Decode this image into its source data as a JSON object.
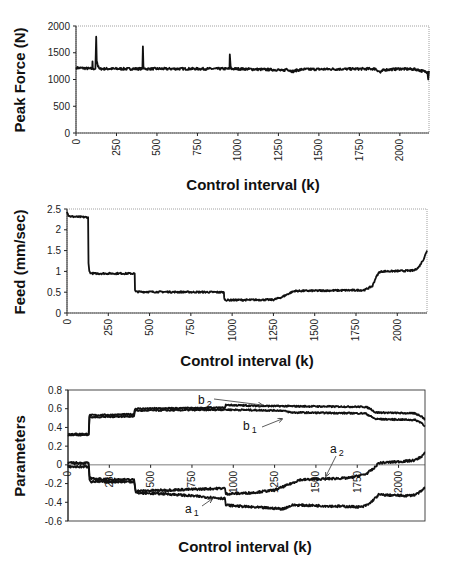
{
  "chart_data": [
    {
      "id": "peak_force",
      "type": "line",
      "title": "",
      "xlabel": "Control interval (k)",
      "ylabel": "Peak Force (N)",
      "xlim": [
        0,
        2180
      ],
      "ylim": [
        0,
        2000
      ],
      "xticks": [
        0,
        250,
        500,
        750,
        1000,
        1250,
        1500,
        1750,
        2000
      ],
      "yticks": [
        0,
        500,
        1000,
        1500,
        2000
      ],
      "ytick_labels": [
        "0",
        "500",
        "1000",
        "1500",
        "2000"
      ],
      "grid": false,
      "series": [
        {
          "name": "Peak Force",
          "color": "#111111",
          "noise": 22,
          "x": [
            0,
            5,
            100,
            102,
            104,
            120,
            125,
            128,
            131,
            135,
            145,
            150,
            400,
            410,
            413,
            416,
            420,
            425,
            940,
            948,
            950,
            955,
            960,
            1000,
            1250,
            1280,
            1300,
            1320,
            1340,
            1360,
            1400,
            1850,
            1880,
            1900,
            2000,
            2100,
            2150,
            2170,
            2175,
            2180
          ],
          "y": [
            1200,
            1220,
            1200,
            1340,
            1200,
            1200,
            1800,
            1350,
            1320,
            1250,
            1200,
            1200,
            1200,
            1200,
            1620,
            1250,
            1200,
            1200,
            1200,
            1200,
            1470,
            1250,
            1200,
            1200,
            1180,
            1160,
            1200,
            1170,
            1150,
            1170,
            1190,
            1200,
            1130,
            1180,
            1200,
            1190,
            1150,
            1140,
            1000,
            1160
          ]
        }
      ]
    },
    {
      "id": "feed",
      "type": "line",
      "title": "",
      "xlabel": "Control interval (k)",
      "ylabel": "Feed (mm/sec)",
      "xlim": [
        0,
        2180
      ],
      "ylim": [
        0,
        2.5
      ],
      "xticks": [
        0,
        250,
        500,
        750,
        1000,
        1250,
        1500,
        1750,
        2000
      ],
      "yticks": [
        0,
        0.5,
        1,
        1.5,
        2,
        2.5
      ],
      "ytick_labels": [
        "0",
        "0.5",
        "1",
        "1.5",
        "2",
        "2.5"
      ],
      "grid": false,
      "series": [
        {
          "name": "Feed",
          "color": "#111111",
          "noise": 0.02,
          "x": [
            0,
            8,
            20,
            128,
            130,
            135,
            145,
            150,
            410,
            412,
            418,
            950,
            952,
            960,
            1250,
            1300,
            1360,
            1380,
            1800,
            1850,
            1870,
            1890,
            1910,
            2100,
            2130,
            2160,
            2180
          ],
          "y": [
            2.45,
            2.35,
            2.32,
            2.3,
            1.2,
            1.0,
            0.96,
            0.95,
            0.95,
            0.55,
            0.51,
            0.5,
            0.35,
            0.31,
            0.32,
            0.38,
            0.5,
            0.53,
            0.55,
            0.65,
            0.85,
            0.98,
            1.0,
            1.02,
            1.1,
            1.3,
            1.5
          ]
        }
      ]
    },
    {
      "id": "parameters",
      "type": "line",
      "title": "",
      "xlabel": "Control interval (k)",
      "ylabel": "Parameters",
      "xlim": [
        0,
        2160
      ],
      "ylim": [
        -0.6,
        0.8
      ],
      "xticks": [
        0,
        250,
        500,
        750,
        1000,
        1250,
        1500,
        1750,
        2000
      ],
      "yticks": [
        -0.6,
        -0.4,
        -0.2,
        0,
        0.2,
        0.4,
        0.6,
        0.8
      ],
      "ytick_labels": [
        "-0.6",
        "-0.4",
        "-0.2",
        "0",
        "0.2",
        "0.4",
        "0.6",
        "0.8"
      ],
      "zero_line": true,
      "grid": false,
      "series": [
        {
          "name": "b2",
          "color": "#111111",
          "noise": 0.008,
          "x": [
            0,
            125,
            130,
            400,
            405,
            950,
            955,
            1150,
            1800,
            1830,
            1860,
            2100,
            2140,
            2160
          ],
          "y": [
            0.33,
            0.33,
            0.53,
            0.54,
            0.6,
            0.61,
            0.64,
            0.63,
            0.62,
            0.6,
            0.56,
            0.55,
            0.52,
            0.48
          ]
        },
        {
          "name": "b1",
          "color": "#111111",
          "noise": 0.008,
          "x": [
            0,
            125,
            130,
            400,
            405,
            950,
            955,
            1300,
            1350,
            1800,
            1830,
            1860,
            2100,
            2140,
            2160
          ],
          "y": [
            0.32,
            0.32,
            0.51,
            0.52,
            0.58,
            0.59,
            0.59,
            0.58,
            0.56,
            0.55,
            0.52,
            0.49,
            0.48,
            0.45,
            0.41
          ]
        },
        {
          "name": "a2",
          "color": "#111111",
          "noise": 0.012,
          "x": [
            0,
            125,
            130,
            140,
            400,
            410,
            600,
            950,
            955,
            1100,
            1250,
            1350,
            1400,
            1700,
            1800,
            1850,
            1880,
            2050,
            2100,
            2140,
            2160
          ],
          "y": [
            0.02,
            0.02,
            -0.12,
            -0.15,
            -0.16,
            -0.28,
            -0.27,
            -0.25,
            -0.31,
            -0.3,
            -0.27,
            -0.2,
            -0.16,
            -0.14,
            -0.1,
            -0.04,
            0.02,
            0.04,
            0.05,
            0.09,
            0.13
          ]
        },
        {
          "name": "a1",
          "color": "#111111",
          "noise": 0.012,
          "x": [
            0,
            125,
            130,
            140,
            400,
            410,
            600,
            950,
            955,
            1100,
            1300,
            1360,
            1400,
            1780,
            1820,
            1880,
            2050,
            2100,
            2140,
            2160
          ],
          "y": [
            -0.02,
            -0.02,
            -0.15,
            -0.18,
            -0.18,
            -0.3,
            -0.31,
            -0.36,
            -0.43,
            -0.45,
            -0.47,
            -0.43,
            -0.43,
            -0.45,
            -0.42,
            -0.32,
            -0.33,
            -0.32,
            -0.28,
            -0.24
          ]
        }
      ],
      "annotations": [
        {
          "label": "b",
          "sub": "2",
          "target": "b2"
        },
        {
          "label": "b",
          "sub": "1",
          "target": "b1"
        },
        {
          "label": "a",
          "sub": "2",
          "target": "a2"
        },
        {
          "label": "a",
          "sub": "1",
          "target": "a1"
        }
      ]
    }
  ],
  "panels": [
    {
      "xlabel": "Control interval (k)",
      "ylabel": "Peak Force (N)"
    },
    {
      "xlabel": "Control interval (k)",
      "ylabel": "Feed (mm/sec)"
    },
    {
      "xlabel": "Control interval (k)",
      "ylabel": "Parameters"
    }
  ]
}
